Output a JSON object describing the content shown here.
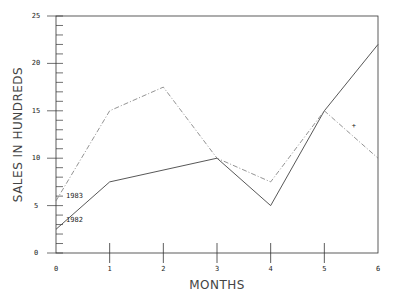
{
  "chart_data": {
    "type": "line",
    "title": "",
    "xlabel": "MONTHS",
    "ylabel": "SALES IN HUNDREDS",
    "x": [
      0,
      1,
      2,
      3,
      4,
      5,
      6
    ],
    "x_ticks": [
      "0",
      "1",
      "2",
      "3",
      "4",
      "5",
      "6"
    ],
    "y_ticks": [
      "0",
      "5",
      "10",
      "15",
      "20",
      "25"
    ],
    "xlim": [
      0,
      6
    ],
    "ylim": [
      0,
      25
    ],
    "grid": false,
    "series": [
      {
        "name": "1982",
        "style": "solid",
        "x": [
          0,
          1,
          3,
          4,
          5,
          6
        ],
        "values": [
          2.5,
          7.5,
          10,
          5,
          15,
          22
        ]
      },
      {
        "name": "1983",
        "style": "dash-dot",
        "x": [
          0,
          1,
          2,
          3,
          4,
          5,
          6
        ],
        "values": [
          5.5,
          15,
          17.5,
          10,
          7.5,
          15,
          10
        ]
      }
    ],
    "annotations": [
      {
        "text": "+",
        "x": 5.55,
        "y": 13.2
      }
    ]
  }
}
